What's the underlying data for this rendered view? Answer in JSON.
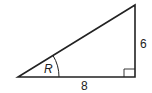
{
  "diagram": {
    "type": "right-triangle",
    "stroke_color": "#222222",
    "vertices": {
      "bottom_left": [
        18,
        77
      ],
      "bottom_right": [
        135,
        77
      ],
      "top_right": [
        135,
        5
      ]
    },
    "labels": {
      "angle": "R",
      "base": "8",
      "height": "6"
    },
    "right_angle_marker": "bottom-right"
  }
}
